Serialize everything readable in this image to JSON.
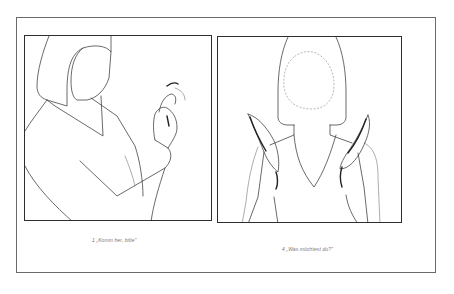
{
  "figures": [
    {
      "number": "1",
      "caption": "1  „Komm her, bitte\"",
      "illustration": "woman-beckoning-gesture"
    },
    {
      "number": "4",
      "caption": "4  „Was möchtest du?\"",
      "illustration": "woman-raised-open-palms-gesture"
    }
  ],
  "colors": {
    "background": "#ffffff",
    "frame": "#6a6a6a",
    "panel_border": "#2e2e2e",
    "line_art": "#444444",
    "caption_text": "#777777"
  }
}
